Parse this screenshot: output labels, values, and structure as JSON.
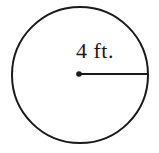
{
  "figure": {
    "kind": "geometry-diagram",
    "background_color": "#ffffff",
    "stroke_color": "#1a1a1a"
  },
  "chart_data": {
    "type": "diagram",
    "title": "",
    "shape": "circle",
    "labels": {
      "radius_label": "4 ft."
    },
    "measurements": [
      {
        "name": "radius",
        "value": 4,
        "unit": "ft.",
        "display": "4 ft."
      }
    ],
    "geometry": {
      "circle": {
        "center_x": 80,
        "center_y": 75,
        "radius": 68,
        "stroke_width": 2,
        "fill": "none"
      },
      "center_point": {
        "x": 79,
        "y": 74,
        "dot_radius": 2.8
      },
      "radius_segment": {
        "x1": 79,
        "y1": 74,
        "x2": 148,
        "y2": 74,
        "stroke_width": 2
      },
      "label_position": {
        "x": 95,
        "y": 58,
        "anchor": "middle"
      }
    }
  }
}
